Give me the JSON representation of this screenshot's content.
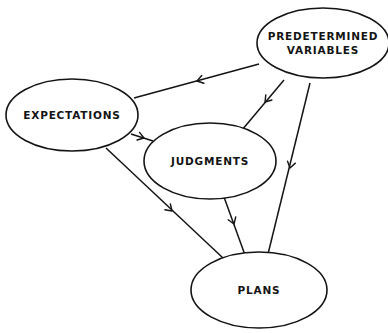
{
  "diagram": {
    "type": "directed-graph",
    "nodes": [
      {
        "id": "predetermined",
        "label_lines": [
          "PREDETERMINED",
          "VARIABLES"
        ],
        "cx": 323,
        "cy": 43,
        "rx": 66,
        "ry": 35
      },
      {
        "id": "expectations",
        "label_lines": [
          "EXPECTATIONS"
        ],
        "cx": 72,
        "cy": 115,
        "rx": 66,
        "ry": 36
      },
      {
        "id": "judgments",
        "label_lines": [
          "JUDGMENTS"
        ],
        "cx": 210,
        "cy": 161,
        "rx": 66,
        "ry": 38
      },
      {
        "id": "plans",
        "label_lines": [
          "PLANS"
        ],
        "cx": 259,
        "cy": 290,
        "rx": 68,
        "ry": 38
      }
    ],
    "edges": [
      {
        "from": "predetermined",
        "to": "expectations",
        "x1": 259,
        "y1": 64,
        "x2": 134,
        "y2": 98,
        "ax": 197,
        "ay": 81
      },
      {
        "from": "predetermined",
        "to": "judgments",
        "x1": 284,
        "y1": 80,
        "x2": 242,
        "y2": 130,
        "ax": 265,
        "ay": 102
      },
      {
        "from": "predetermined",
        "to": "plans",
        "x1": 310,
        "y1": 83,
        "x2": 268,
        "y2": 254,
        "ax": 290,
        "ay": 168
      },
      {
        "from": "expectations",
        "to": "judgments",
        "x1": 131,
        "y1": 134,
        "x2": 153,
        "y2": 141,
        "ax": 144,
        "ay": 138
      },
      {
        "from": "expectations",
        "to": "plans",
        "x1": 106,
        "y1": 148,
        "x2": 223,
        "y2": 258,
        "ax": 172,
        "ay": 211
      },
      {
        "from": "judgments",
        "to": "plans",
        "x1": 224,
        "y1": 197,
        "x2": 245,
        "y2": 255,
        "ax": 234,
        "ay": 224
      }
    ],
    "colors": {
      "line": "#141414",
      "background": "#ffffff"
    }
  }
}
